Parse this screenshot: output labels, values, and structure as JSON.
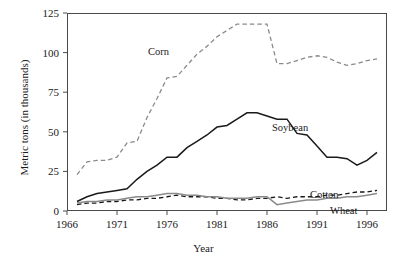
{
  "chart_data": {
    "type": "line",
    "title": "",
    "xlabel": "Year",
    "ylabel": "Metric tons (in thousands)",
    "xlim": [
      1966,
      1998
    ],
    "ylim": [
      0,
      125
    ],
    "xticks": [
      1966,
      1971,
      1976,
      1981,
      1986,
      1991,
      1996
    ],
    "yticks": [
      0,
      25,
      50,
      75,
      100,
      125
    ],
    "grid": false,
    "legend": "inline-annotations",
    "x": [
      1967,
      1968,
      1969,
      1970,
      1971,
      1972,
      1973,
      1974,
      1975,
      1976,
      1977,
      1978,
      1979,
      1980,
      1981,
      1982,
      1983,
      1984,
      1985,
      1986,
      1987,
      1988,
      1989,
      1990,
      1991,
      1992,
      1993,
      1994,
      1995,
      1996,
      1997
    ],
    "series": [
      {
        "name": "Corn",
        "color": "#8a8a8a",
        "style": "dashed",
        "values": [
          23,
          31,
          32,
          32,
          34,
          43,
          44,
          59,
          71,
          84,
          85,
          92,
          99,
          104,
          110,
          114,
          118,
          118,
          118,
          118,
          93,
          93,
          95,
          97,
          98,
          97,
          94,
          92,
          93,
          95,
          96
        ]
      },
      {
        "name": "Soybean",
        "color": "#1a1a1a",
        "style": "solid",
        "values": [
          6,
          9,
          11,
          12,
          13,
          14,
          20,
          25,
          29,
          34,
          34,
          40,
          44,
          48,
          53,
          54,
          58,
          62,
          62,
          60,
          58,
          58,
          49,
          48,
          41,
          34,
          34,
          33,
          29,
          32,
          37
        ]
      },
      {
        "name": "Cotton",
        "color": "#1a1a1a",
        "style": "dashed",
        "values": [
          4,
          5,
          5,
          6,
          6,
          7,
          7,
          8,
          8,
          9,
          10,
          9,
          9,
          9,
          8,
          8,
          7,
          7,
          8,
          8,
          9,
          8,
          9,
          9,
          9,
          10,
          10,
          11,
          12,
          12,
          13
        ]
      },
      {
        "name": "Wheat",
        "color": "#8a8a8a",
        "style": "solid",
        "values": [
          5,
          6,
          6,
          7,
          7,
          8,
          9,
          9,
          10,
          11,
          11,
          10,
          10,
          9,
          9,
          8,
          8,
          8,
          9,
          9,
          4,
          5,
          6,
          7,
          7,
          8,
          8,
          9,
          9,
          10,
          11
        ]
      }
    ],
    "annotations": [
      {
        "text": "Corn",
        "series": "Corn"
      },
      {
        "text": "Soybean",
        "series": "Soybean"
      },
      {
        "text": "Cotton",
        "series": "Cotton"
      },
      {
        "text": "Wheat",
        "series": "Wheat"
      }
    ]
  }
}
